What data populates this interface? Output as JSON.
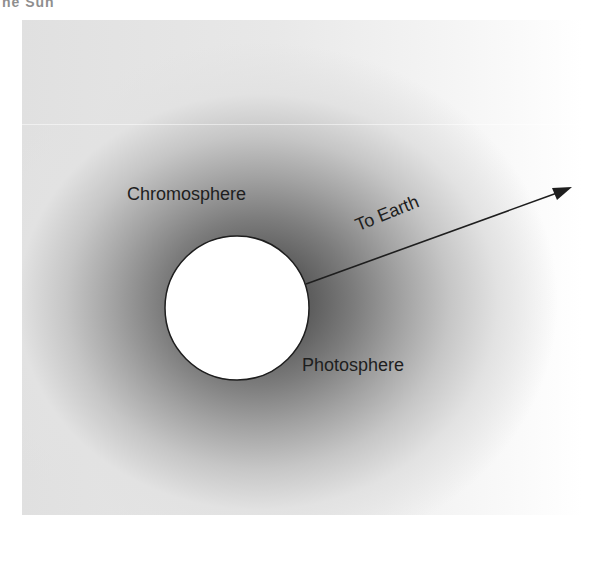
{
  "heading_fragment": "he Sun",
  "diagram": {
    "labels": {
      "chromosphere": "Chromosphere",
      "photosphere": "Photosphere",
      "arrow": "To Earth"
    },
    "colors": {
      "chromosphere_core": "#4a4a4a",
      "photosphere_fill": "#ffffff",
      "outline": "#1e1e1e",
      "background": "#ffffff"
    },
    "shapes": {
      "photosphere_circle": {
        "cx": 237,
        "cy": 308,
        "r": 72
      },
      "arrow": {
        "x1": 306,
        "y1": 284,
        "x2": 572,
        "y2": 187
      }
    }
  }
}
